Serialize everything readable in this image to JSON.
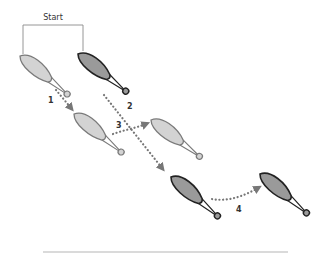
{
  "diagram": {
    "start_label": "Start",
    "colors": {
      "light_fill": "#d3d3d3",
      "light_stroke": "#7a7a7a",
      "dark_fill": "#9a9a9a",
      "dark_stroke": "#222222",
      "arrow": "#777777",
      "bracket": "#8a8a8a",
      "baseline": "#b5b5b5"
    },
    "paddles": [
      {
        "id": "p1",
        "shade": "light",
        "role": "start-light"
      },
      {
        "id": "p2",
        "shade": "dark",
        "role": "start-dark"
      },
      {
        "id": "p3",
        "shade": "light",
        "role": "after-step-1"
      },
      {
        "id": "p4",
        "shade": "light",
        "role": "after-step-3"
      },
      {
        "id": "p5",
        "shade": "dark",
        "role": "after-step-2"
      },
      {
        "id": "p6",
        "shade": "dark",
        "role": "after-step-4"
      }
    ],
    "steps": [
      {
        "label": "1"
      },
      {
        "label": "2"
      },
      {
        "label": "3"
      },
      {
        "label": "4"
      }
    ]
  }
}
